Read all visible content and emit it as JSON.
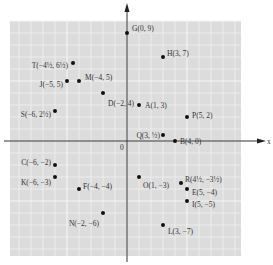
{
  "diagram": {
    "type": "coordinate-plane",
    "axes": {
      "x_label": "x",
      "origin_label": "0"
    },
    "grid": {
      "x_range": [
        -10,
        9
      ],
      "y_range": [
        -9,
        10
      ],
      "unit_px": 12,
      "origin_px": [
        127,
        141
      ]
    },
    "colors": {
      "grid_bg": "#dcdcdc",
      "grid_line": "#f4f4f4",
      "axis": "#333333",
      "point": "#111111",
      "text": "#333333"
    },
    "points": [
      {
        "name": "G",
        "label": "G(0, 9)",
        "x": 0,
        "y": 9
      },
      {
        "name": "H",
        "label": "H(3, 7)",
        "x": 3,
        "y": 7
      },
      {
        "name": "T",
        "label": "T(−4½, 6½)",
        "x": -4.5,
        "y": 6.5
      },
      {
        "name": "M",
        "label": "M(−4, 5)",
        "x": -4,
        "y": 5
      },
      {
        "name": "J",
        "label": "J(−5, 5)",
        "x": -5,
        "y": 5
      },
      {
        "name": "D",
        "label": "D(−2, 4)",
        "x": -2,
        "y": 4
      },
      {
        "name": "A",
        "label": "A(1, 3)",
        "x": 1,
        "y": 3
      },
      {
        "name": "S",
        "label": "S(−6, 2½)",
        "x": -6,
        "y": 2.5
      },
      {
        "name": "P",
        "label": "P(5, 2)",
        "x": 5,
        "y": 2
      },
      {
        "name": "Q",
        "label": "Q(3, ½)",
        "x": 3,
        "y": 0.5
      },
      {
        "name": "B",
        "label": "B(4, 0)",
        "x": 4,
        "y": 0
      },
      {
        "name": "C",
        "label": "C(−6, −2)",
        "x": -6,
        "y": -2
      },
      {
        "name": "K",
        "label": "K(−6, −3)",
        "x": -6,
        "y": -3
      },
      {
        "name": "F",
        "label": "F(−4, −4)",
        "x": -4,
        "y": -4
      },
      {
        "name": "O",
        "label": "O(1, −3)",
        "x": 1,
        "y": -3
      },
      {
        "name": "R",
        "label": "R(4½, −3½)",
        "x": 4.5,
        "y": -3.5
      },
      {
        "name": "E",
        "label": "E(5, −4)",
        "x": 5,
        "y": -4
      },
      {
        "name": "I",
        "label": "I(5, −5)",
        "x": 5,
        "y": -5
      },
      {
        "name": "N",
        "label": "N(−2, −6)",
        "x": -2,
        "y": -6
      },
      {
        "name": "L",
        "label": "L(3, −7)",
        "x": 3,
        "y": -7
      }
    ]
  }
}
